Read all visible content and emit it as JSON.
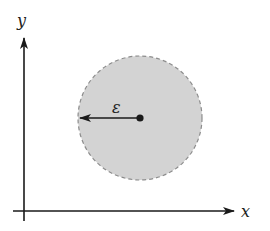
{
  "diagram": {
    "axes": {
      "x_label": "x",
      "y_label": "y"
    },
    "disk": {
      "center": [
        140,
        118
      ],
      "radius": 62,
      "fill": "#d3d3d3",
      "border": "dashed",
      "border_color": "#8c8c8c"
    },
    "radius_arrow": {
      "label": "ε",
      "direction": "left"
    },
    "colors": {
      "ink": "#1a1a1a"
    }
  }
}
